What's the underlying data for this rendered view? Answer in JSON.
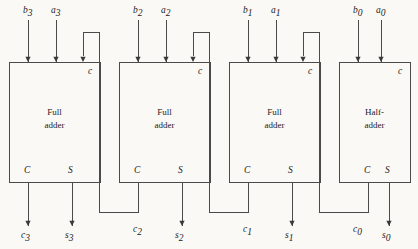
{
  "figure": {
    "name": "4-bit ripple-carry adder",
    "background_color": "#faf9f6",
    "line_color": "#4a4a4a",
    "text_color": "#1c1c1c",
    "width": 418,
    "height": 249
  },
  "blocks": [
    {
      "id": "adder-3",
      "label_line1": "Full",
      "label_line2": "adder",
      "carry_in_port": "c",
      "carry_out_port": "C",
      "sum_port": "S",
      "inputs": [
        {
          "name": "b",
          "subscript": "3"
        },
        {
          "name": "a",
          "subscript": "3"
        }
      ],
      "outputs": [
        {
          "name": "c",
          "subscript": "3"
        },
        {
          "name": "s",
          "subscript": "3"
        }
      ],
      "geometry": {
        "x": 9,
        "y": 62,
        "w": 91,
        "h": 120
      },
      "ports": {
        "b_x": 28,
        "a_x": 56,
        "cin_x": 83,
        "cout_x": 28,
        "sum_x": 72
      },
      "has_carry_in_arrow": true
    },
    {
      "id": "adder-2",
      "label_line1": "Full",
      "label_line2": "adder",
      "carry_in_port": "c",
      "carry_out_port": "C",
      "sum_port": "S",
      "inputs": [
        {
          "name": "b",
          "subscript": "2"
        },
        {
          "name": "a",
          "subscript": "2"
        }
      ],
      "outputs": [
        {
          "name": "c",
          "subscript": "2"
        },
        {
          "name": "s",
          "subscript": "2"
        }
      ],
      "geometry": {
        "x": 119,
        "y": 62,
        "w": 91,
        "h": 120
      },
      "ports": {
        "b_x": 138,
        "a_x": 166,
        "cin_x": 193,
        "cout_x": 138,
        "sum_x": 182
      },
      "has_carry_in_arrow": true
    },
    {
      "id": "adder-1",
      "label_line1": "Full",
      "label_line2": "adder",
      "carry_in_port": "c",
      "carry_out_port": "C",
      "sum_port": "S",
      "inputs": [
        {
          "name": "b",
          "subscript": "1"
        },
        {
          "name": "a",
          "subscript": "1"
        }
      ],
      "outputs": [
        {
          "name": "c",
          "subscript": "1"
        },
        {
          "name": "s",
          "subscript": "1"
        }
      ],
      "geometry": {
        "x": 229,
        "y": 62,
        "w": 91,
        "h": 120
      },
      "ports": {
        "b_x": 248,
        "a_x": 276,
        "cin_x": 303,
        "cout_x": 248,
        "sum_x": 292
      },
      "has_carry_in_arrow": true
    },
    {
      "id": "adder-0",
      "label_line1": "Half-",
      "label_line2": "adder",
      "carry_in_port": "c",
      "carry_out_port": "C",
      "sum_port": "S",
      "inputs": [
        {
          "name": "b",
          "subscript": "0"
        },
        {
          "name": "a",
          "subscript": "0"
        }
      ],
      "outputs": [
        {
          "name": "c",
          "subscript": "0"
        },
        {
          "name": "s",
          "subscript": "0"
        }
      ],
      "geometry": {
        "x": 339,
        "y": 62,
        "w": 71,
        "h": 120
      },
      "ports": {
        "b_x": 358,
        "a_x": 381,
        "cin_x": 0,
        "cout_x": 368,
        "sum_x": 389
      },
      "has_carry_in_arrow": false
    }
  ],
  "carry_chain": [
    {
      "id": "carry-2-to-3",
      "from_block": "adder-2",
      "to_block": "adder-3",
      "label": "c",
      "label_subscript": "2",
      "label_x": 133,
      "label_y": 232,
      "path": "M 138,182 L 138,212 L 99,212 L 99,32 L 83,32 L 83,56"
    },
    {
      "id": "carry-1-to-2",
      "from_block": "adder-1",
      "to_block": "adder-2",
      "label": "c",
      "label_subscript": "1",
      "label_x": 243,
      "label_y": 232,
      "path": "M 248,182 L 248,212 L 209,212 L 209,32 L 193,32 L 193,56"
    },
    {
      "id": "carry-0-to-1",
      "from_block": "adder-0",
      "to_block": "adder-1",
      "label": "c",
      "label_subscript": "0",
      "label_x": 353,
      "label_y": 232,
      "path": "M 368,182 L 368,212 L 319,212 L 319,32 L 303,32 L 303,56"
    }
  ],
  "input_stubs": [
    {
      "id": "in-b3",
      "x": 28,
      "label": "b",
      "subscript": "3",
      "label_x": 23,
      "label_y": 13
    },
    {
      "id": "in-a3",
      "x": 56,
      "label": "a",
      "subscript": "3",
      "label_x": 51,
      "label_y": 13
    },
    {
      "id": "in-b2",
      "x": 138,
      "label": "b",
      "subscript": "2",
      "label_x": 133,
      "label_y": 13
    },
    {
      "id": "in-a2",
      "x": 166,
      "label": "a",
      "subscript": "2",
      "label_x": 161,
      "label_y": 13
    },
    {
      "id": "in-b1",
      "x": 248,
      "label": "b",
      "subscript": "1",
      "label_x": 243,
      "label_y": 13
    },
    {
      "id": "in-a1",
      "x": 276,
      "label": "a",
      "subscript": "1",
      "label_x": 271,
      "label_y": 13
    },
    {
      "id": "in-b0",
      "x": 358,
      "label": "b",
      "subscript": "0",
      "label_x": 353,
      "label_y": 13
    },
    {
      "id": "in-a0",
      "x": 381,
      "label": "a",
      "subscript": "0",
      "label_x": 376,
      "label_y": 13
    }
  ],
  "output_stubs": [
    {
      "id": "out-c3",
      "x": 28,
      "label": "c",
      "subscript": "3",
      "label_x": 21,
      "label_y": 238
    },
    {
      "id": "out-s3",
      "x": 72,
      "label": "s",
      "subscript": "3",
      "label_x": 65,
      "label_y": 238
    },
    {
      "id": "out-s2",
      "x": 182,
      "label": "s",
      "subscript": "2",
      "label_x": 175,
      "label_y": 238
    },
    {
      "id": "out-s1",
      "x": 292,
      "label": "s",
      "subscript": "1",
      "label_x": 285,
      "label_y": 238
    },
    {
      "id": "out-s0",
      "x": 389,
      "label": "s",
      "subscript": "0",
      "label_x": 382,
      "label_y": 238
    }
  ]
}
